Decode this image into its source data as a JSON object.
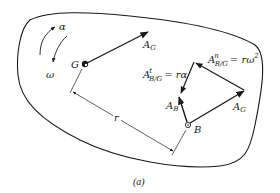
{
  "figure": {
    "caption": "(a)",
    "colors": {
      "stroke": "#1a1a1a",
      "background": "#ffffff"
    }
  },
  "labels": {
    "alpha": "α",
    "omega": "ω",
    "G": "G",
    "A_G_top": {
      "main": "A",
      "sub": "G"
    },
    "r": "r",
    "B": "B",
    "A_B": {
      "main": "A",
      "sub": "B"
    },
    "A_G_at_B": {
      "main": "A",
      "sub": "G"
    },
    "A_tangential": {
      "main": "A",
      "sup": "t",
      "sub": "B/G",
      "rhs": "= rα"
    },
    "A_normal": {
      "main": "A",
      "sup": "n",
      "sub": "B/G",
      "rhs": "= rω",
      "rhs_sup": "2"
    }
  }
}
